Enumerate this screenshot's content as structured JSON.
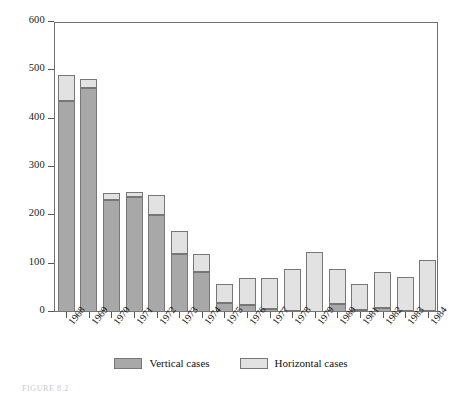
{
  "figure": {
    "caption": "FIGURE 8.2"
  },
  "legend": {
    "position": "bottom-center",
    "items": [
      {
        "label": "Vertical cases",
        "color": "#a8a8a8",
        "swatch_name": "legend-swatch-vertical"
      },
      {
        "label": "Horizontal cases",
        "color": "#e2e2e2",
        "swatch_name": "legend-swatch-horizontal"
      }
    ]
  },
  "axes": {
    "y_ticks": [
      "0",
      "100",
      "200",
      "300",
      "400",
      "500",
      "600"
    ],
    "x_ticks": [
      "1968",
      "1969",
      "1970",
      "1971",
      "1972",
      "1973",
      "1974",
      "1975",
      "1976",
      "1977",
      "1978",
      "1979",
      "1980",
      "1981",
      "1982",
      "1983",
      "1984"
    ]
  },
  "chart_data": {
    "type": "bar",
    "title": "",
    "subtitle": "",
    "xlabel": "",
    "ylabel": "",
    "stacked": true,
    "grid": false,
    "legend_position": "bottom-center",
    "ylim": [
      0,
      600
    ],
    "ytick_step": 100,
    "categories": [
      "1968",
      "1969",
      "1970",
      "1971",
      "1972",
      "1973",
      "1974",
      "1975",
      "1976",
      "1977",
      "1978",
      "1979",
      "1980",
      "1981",
      "1982",
      "1983",
      "1984"
    ],
    "series": [
      {
        "name": "Vertical cases",
        "color": "#a8a8a8",
        "values": [
          437,
          463,
          232,
          237,
          200,
          120,
          83,
          18,
          14,
          6,
          3,
          0,
          17,
          4,
          8,
          3,
          3
        ]
      },
      {
        "name": "Horizontal cases",
        "color": "#e2e2e2",
        "values": [
          53,
          19,
          14,
          11,
          43,
          48,
          38,
          40,
          57,
          64,
          85,
          125,
          73,
          54,
          74,
          69,
          104
        ]
      }
    ],
    "totals": [
      490,
      482,
      246,
      248,
      243,
      168,
      121,
      58,
      71,
      70,
      88,
      125,
      90,
      58,
      82,
      72,
      107
    ]
  },
  "style": {
    "frame_color": "#6f6f6f",
    "bar_border": "#777777",
    "background": "#ffffff"
  }
}
